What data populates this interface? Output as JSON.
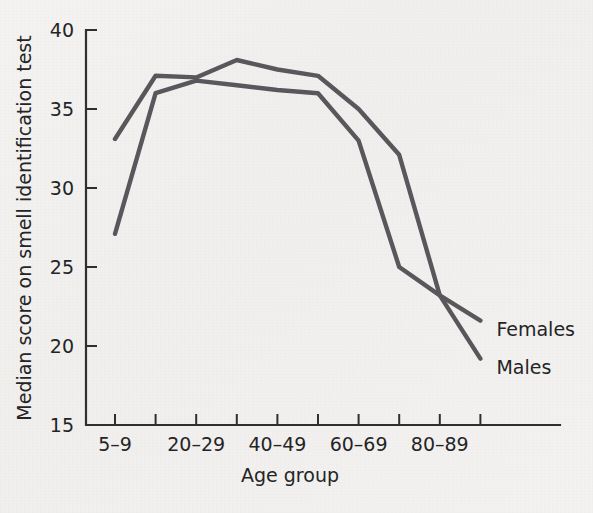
{
  "chart_data": {
    "type": "line",
    "title": "",
    "xlabel": "Age group",
    "ylabel": "Median score on smell identification test",
    "ylim": [
      15,
      40
    ],
    "yticks": [
      15,
      20,
      25,
      30,
      35,
      40
    ],
    "ytick_labels": [
      "15",
      "20",
      "25",
      "30",
      "35",
      "40"
    ],
    "grid": false,
    "legend_position": "right-inline",
    "categories": [
      "5–9",
      "10–19",
      "20–29",
      "30–39",
      "40–49",
      "50–59",
      "60–69",
      "70–79",
      "80–89",
      "90–99"
    ],
    "xtick_labels": [
      "5–9",
      "",
      "20–29",
      "",
      "40–49",
      "",
      "60–69",
      "",
      "80–89",
      ""
    ],
    "series": [
      {
        "name": "Females",
        "color": "#58585c",
        "values": [
          33.1,
          37.1,
          37.0,
          38.1,
          37.5,
          37.1,
          35.0,
          32.1,
          23.2,
          21.6
        ]
      },
      {
        "name": "Males",
        "color": "#58585c",
        "values": [
          27.1,
          36.0,
          36.8,
          36.5,
          36.2,
          36.0,
          33.0,
          25.0,
          23.2,
          19.2
        ]
      }
    ],
    "annotations": [
      {
        "text": "Females",
        "series": "Females"
      },
      {
        "text": "Males",
        "series": "Males"
      }
    ]
  },
  "colors": {
    "background": "#f2f1ef",
    "axis": "#2f2f31",
    "line": "#58585c",
    "text": "#242426"
  }
}
